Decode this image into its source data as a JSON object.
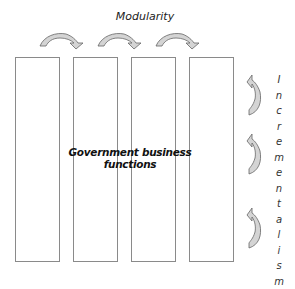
{
  "diagram": {
    "top_label": "Modularity",
    "center_label_line1": "Government business",
    "center_label_line2": "functions",
    "side_label": "Incrementalism",
    "side_label_letters": [
      "I",
      "n",
      "c",
      "r",
      "e",
      "m",
      "e",
      "n",
      "t",
      "a",
      "l",
      "i",
      "s",
      "m"
    ],
    "columns": [
      {
        "id": "column-1"
      },
      {
        "id": "column-2"
      },
      {
        "id": "column-3"
      },
      {
        "id": "column-4"
      }
    ],
    "horizontal_arrows": 3,
    "vertical_arrows": 3,
    "colors": {
      "box_border": "#8a8a8a",
      "arrow_fill": "#d4d4d4",
      "arrow_stroke": "#666666",
      "text": "#111111"
    }
  }
}
